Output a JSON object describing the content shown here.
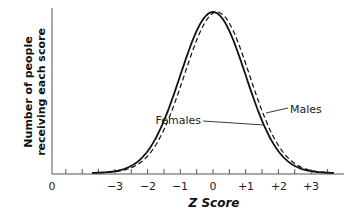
{
  "chart_data": {
    "type": "line",
    "title": "",
    "xlabel": "Z Score",
    "ylabel_lines": [
      "Number of people",
      "receiving each score"
    ],
    "x_ticks": [
      "0",
      "−3",
      "−2",
      "−1",
      "0",
      "+1",
      "+2",
      "+3"
    ],
    "x_tick_values": [
      null,
      -3,
      -2,
      -1,
      0,
      1,
      2,
      3
    ],
    "xlim": [
      -4.9,
      4.0
    ],
    "grid": false,
    "series": [
      {
        "name": "Females",
        "style": "solid",
        "mean": 0.0,
        "sd": 1.0,
        "color": "#111111"
      },
      {
        "name": "Males",
        "style": "dashed",
        "mean": 0.12,
        "sd": 1.0,
        "color": "#111111"
      }
    ],
    "annotations": [
      {
        "text": "Females",
        "points_to": "Females curve near z=+1.3"
      },
      {
        "text": "Males",
        "points_to": "Males curve near z=+1.4"
      }
    ]
  }
}
